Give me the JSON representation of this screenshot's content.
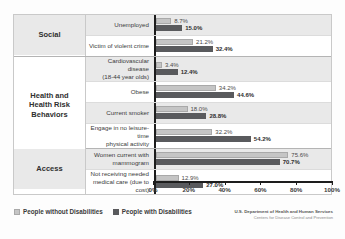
{
  "chart_data": {
    "type": "bar",
    "orientation": "horizontal",
    "title": "",
    "xlabel": "",
    "ylabel": "",
    "xlim": [
      0,
      100
    ],
    "grid": false,
    "legend_position": "bottom-left",
    "tick_labels": [
      "0%",
      "20%",
      "40%",
      "60%",
      "80%",
      "100%"
    ],
    "tick_values": [
      0,
      20,
      40,
      60,
      80,
      100
    ],
    "series": [
      {
        "name": "People without Disabilities",
        "color": "#c5c5c5",
        "values": [
          8.7,
          21.2,
          3.4,
          34.2,
          18.0,
          32.2,
          75.6,
          12.9
        ],
        "labels": [
          "8.7%",
          "21.2%",
          "3.4%",
          "34.2%",
          "18.0%",
          "32.2%",
          "75.6%",
          "12.9%"
        ]
      },
      {
        "name": "People with Disabilities",
        "color": "#595a5d",
        "values": [
          15.0,
          32.4,
          12.4,
          44.6,
          28.8,
          54.2,
          70.7,
          27.0
        ],
        "labels": [
          "15.0%",
          "32.4%",
          "12.4%",
          "44.6%",
          "28.8%",
          "54.2%",
          "70.7%",
          "27.0%"
        ]
      }
    ],
    "categories": [
      "Unemployed",
      "Victim of violent crime",
      "Cardiovascular disease (18-44 year olds)",
      "Obese",
      "Current smoker",
      "Engage in no leisure-time physical activity",
      "Women current with mammogram",
      "Not receiving needed medical care (due to cost)"
    ],
    "groups": [
      {
        "name": "Social",
        "rows": 2
      },
      {
        "name": "Health and Health Risk Behaviors",
        "rows": 4
      },
      {
        "name": "Access",
        "rows": 2
      }
    ]
  },
  "groups": [
    {
      "name": "Social",
      "lines": [
        "Social"
      ],
      "span": 2,
      "shade": true
    },
    {
      "name": "Health and Health Risk Behaviors",
      "lines": [
        "Health and",
        "Health Risk",
        "Behaviors"
      ],
      "span": 4,
      "shade": false
    },
    {
      "name": "Access",
      "lines": [
        "Access"
      ],
      "span": 2,
      "shade": true
    }
  ],
  "rows": [
    {
      "label_lines": [
        "Unemployed"
      ],
      "light": "8.7%",
      "dark": "15.0%",
      "light_val": 8.7,
      "dark_val": 15.0,
      "shade": true
    },
    {
      "label_lines": [
        "Victim of violent crime"
      ],
      "light": "21.2%",
      "dark": "32.4%",
      "light_val": 21.2,
      "dark_val": 32.4,
      "shade": false
    },
    {
      "label_lines": [
        "Cardiovascular disease",
        "(18-44 year olds)"
      ],
      "light": "3.4%",
      "dark": "12.4%",
      "light_val": 3.4,
      "dark_val": 12.4,
      "shade": true
    },
    {
      "label_lines": [
        "Obese"
      ],
      "light": "34.2%",
      "dark": "44.6%",
      "light_val": 34.2,
      "dark_val": 44.6,
      "shade": false
    },
    {
      "label_lines": [
        "Current smoker"
      ],
      "light": "18.0%",
      "dark": "28.8%",
      "light_val": 18.0,
      "dark_val": 28.8,
      "shade": true
    },
    {
      "label_lines": [
        "Engage in no leisure-time",
        "physical activity"
      ],
      "light": "32.2%",
      "dark": "54.2%",
      "light_val": 32.2,
      "dark_val": 54.2,
      "shade": false
    },
    {
      "label_lines": [
        "Women current with",
        "mammogram"
      ],
      "light": "75.6%",
      "dark": "70.7%",
      "light_val": 75.6,
      "dark_val": 70.7,
      "shade": true
    },
    {
      "label_lines": [
        "Not receiving needed",
        "medical care (due to cost)"
      ],
      "light": "12.9%",
      "dark": "27.0%",
      "light_val": 12.9,
      "dark_val": 27.0,
      "shade": false
    }
  ],
  "legend": [
    {
      "label": "People without Disabilities",
      "style": "light"
    },
    {
      "label": "People with Disabilities",
      "style": "dark"
    }
  ],
  "attribution": {
    "line1": "U.S. Department of Health and Human Services",
    "line2": "Centers for Disease Control and Prevention"
  }
}
